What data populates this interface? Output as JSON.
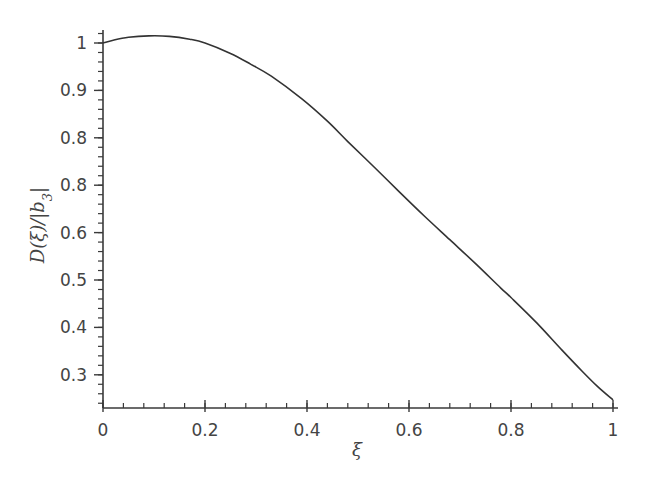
{
  "chart_data": {
    "type": "line",
    "title": "",
    "xlabel": "ξ",
    "ylabel": "D(ξ)/|b3|",
    "ylabel_parts": {
      "main": "D(ξ)/|b",
      "sub": "3",
      "tail": "|"
    },
    "xlim": [
      0,
      1
    ],
    "ylim": [
      0.235,
      1.03
    ],
    "grid": false,
    "legend": null,
    "x_ticks": [
      {
        "value": 0,
        "label": "0"
      },
      {
        "value": 0.2,
        "label": "0.2"
      },
      {
        "value": 0.4,
        "label": "0.4"
      },
      {
        "value": 0.6,
        "label": "0.6"
      },
      {
        "value": 0.8,
        "label": "0.8"
      },
      {
        "value": 1.0,
        "label": "1"
      }
    ],
    "y_ticks": [
      {
        "value": 1.0,
        "label": "1"
      },
      {
        "value": 0.9,
        "label": "0.9"
      },
      {
        "value": 0.8,
        "label": "0.8"
      },
      {
        "value": 0.7,
        "label": "0.8"
      },
      {
        "value": 0.6,
        "label": "0.6"
      },
      {
        "value": 0.5,
        "label": "0.5"
      },
      {
        "value": 0.4,
        "label": "0.4"
      },
      {
        "value": 0.3,
        "label": "0.3"
      }
    ],
    "x_minor_step": 0.04,
    "y_minor_step": 0.02,
    "series": [
      {
        "name": "D(ξ)/|b3|",
        "color": "#333333",
        "x": [
          0.0,
          0.02,
          0.05,
          0.09,
          0.13,
          0.17,
          0.2,
          0.25,
          0.29,
          0.33,
          0.39,
          0.44,
          0.48,
          0.53,
          0.58,
          0.63,
          0.68,
          0.73,
          0.78,
          0.8,
          0.85,
          0.9,
          0.94,
          0.97,
          1.0
        ],
        "values": [
          1.0,
          1.006,
          1.012,
          1.015,
          1.014,
          1.008,
          1.0,
          0.978,
          0.955,
          0.93,
          0.882,
          0.835,
          0.792,
          0.74,
          0.687,
          0.635,
          0.585,
          0.535,
          0.483,
          0.463,
          0.41,
          0.352,
          0.307,
          0.275,
          0.247
        ]
      }
    ]
  }
}
